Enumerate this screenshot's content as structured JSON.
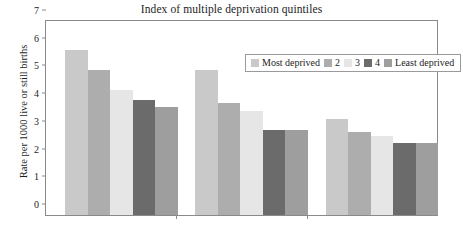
{
  "chart_data": {
    "type": "bar",
    "title": "Index of multiple deprivation quintiles",
    "xlabel": "",
    "ylabel": "Rate per 1000 live or still births",
    "ylim": [
      0,
      7
    ],
    "yticks": [
      "0",
      "1",
      "2",
      "3",
      "4",
      "5",
      "6",
      "7"
    ],
    "grid": false,
    "legend_position": "top-right-inside",
    "categories": [
      "Group 1",
      "Group 2",
      "Group 3"
    ],
    "series": [
      {
        "name": "Most deprived",
        "color": "#c9c9c9",
        "values": [
          5.95,
          5.25,
          3.45
        ]
      },
      {
        "name": "2",
        "color": "#adadad",
        "values": [
          5.25,
          4.05,
          2.98
        ]
      },
      {
        "name": "3",
        "color": "#e6e6e6",
        "values": [
          4.5,
          3.75,
          2.85
        ]
      },
      {
        "name": "4",
        "color": "#6b6b6b",
        "values": [
          4.15,
          3.05,
          2.6
        ]
      },
      {
        "name": "Least deprived",
        "color": "#9e9e9e",
        "values": [
          3.9,
          3.05,
          2.6
        ]
      }
    ]
  },
  "legend": {
    "entries": [
      {
        "label": "Most deprived",
        "color": "#c9c9c9"
      },
      {
        "label": "2",
        "color": "#adadad"
      },
      {
        "label": "3",
        "color": "#e6e6e6"
      },
      {
        "label": "4",
        "color": "#6b6b6b"
      },
      {
        "label": "Least deprived",
        "color": "#9e9e9e"
      }
    ]
  },
  "axes": {
    "frame_color": "#8a8a8a"
  }
}
